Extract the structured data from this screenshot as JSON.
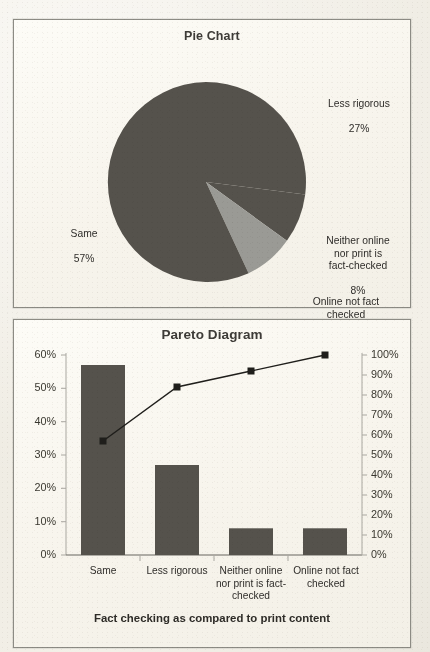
{
  "page": {
    "background_color": "#f1eee6",
    "panel_color": "#f8f5ee",
    "border_color": "#8c8b84",
    "ink_color": "#2f2d2a"
  },
  "pie_panel": {
    "title": "Pie Chart"
  },
  "pareto_panel": {
    "title": "Pareto Diagram",
    "axis_title": "Fact checking as compared to print content"
  },
  "chart_data": [
    {
      "type": "pie",
      "title": "Pie Chart",
      "categories": [
        "Less rigorous",
        "Neither online nor print is fact-checked",
        "Online not fact checked",
        "Same"
      ],
      "values": [
        27,
        8,
        8,
        57
      ],
      "value_labels": [
        "27%",
        "8%",
        "8%",
        "57%"
      ],
      "labels": [
        {
          "name": "Less rigorous",
          "value": "27%",
          "position": "right-top"
        },
        {
          "name": "Neither online\nnor print is\nfact-checked",
          "value": "8%",
          "position": "right-middle"
        },
        {
          "name": "Online not fact\nchecked",
          "value": "8%",
          "position": "right-bottom"
        },
        {
          "name": "Same",
          "value": "57%",
          "position": "left"
        }
      ],
      "slice_colors": [
        "#55524c",
        "#55524c",
        "#9a9a95",
        "#55524c"
      ],
      "start_angle_deg": 0,
      "direction": "clockwise",
      "legend": "none",
      "grid": false
    },
    {
      "type": "bar",
      "title": "Pareto Diagram",
      "categories": [
        "Same",
        "Less rigorous",
        "Neither online nor print is fact-checked",
        "Online not fact checked"
      ],
      "category_display": [
        "Same",
        "Less rigorous",
        "Neither online\nnor print is fact-\nchecked",
        "Online not fact\nchecked"
      ],
      "series": [
        {
          "name": "Frequency",
          "type": "bar",
          "values": [
            57,
            27,
            8,
            8
          ],
          "axis": "left",
          "color": "#55524c"
        },
        {
          "name": "Cumulative %",
          "type": "line",
          "values": [
            57,
            84,
            92,
            100
          ],
          "axis": "right",
          "color": "#1f1e1b"
        }
      ],
      "xlabel": "Fact checking as compared to print content",
      "ylabel": "",
      "ylim": [
        0,
        60
      ],
      "y_ticks_left": [
        "0%",
        "10%",
        "20%",
        "30%",
        "40%",
        "50%",
        "60%"
      ],
      "y2lim": [
        0,
        100
      ],
      "y_ticks_right": [
        "0%",
        "10%",
        "20%",
        "30%",
        "40%",
        "50%",
        "60%",
        "70%",
        "80%",
        "90%",
        "100%"
      ],
      "grid": false,
      "legend": "none"
    }
  ]
}
